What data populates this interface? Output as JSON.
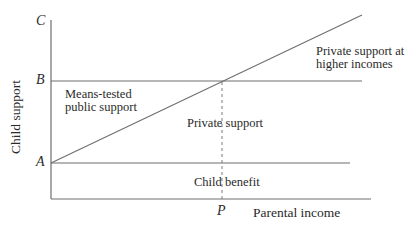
{
  "diagram": {
    "type": "economic-diagram",
    "y_axis": {
      "label": "Child support",
      "ticks": [
        {
          "label": "A",
          "y": 163
        },
        {
          "label": "B",
          "y": 81
        },
        {
          "label": "C",
          "y": 22
        }
      ]
    },
    "x_axis": {
      "label": "Parental income",
      "ticks": [
        {
          "label": "P",
          "x": 222
        }
      ]
    },
    "regions": {
      "means_tested_line1": "Means-tested",
      "means_tested_line2": "public support",
      "private_support": "Private support",
      "child_benefit": "Child benefit",
      "private_higher_line1": "Private support at",
      "private_higher_line2": "higher incomes"
    },
    "lines": [
      {
        "name": "y-axis",
        "x1": 51,
        "y1": 20,
        "x2": 51,
        "y2": 199
      },
      {
        "name": "x-axis",
        "x1": 51,
        "y1": 199,
        "x2": 371,
        "y2": 199
      },
      {
        "name": "level-B",
        "x1": 51,
        "y1": 81,
        "x2": 362,
        "y2": 81
      },
      {
        "name": "level-A",
        "x1": 51,
        "y1": 163,
        "x2": 350,
        "y2": 163
      },
      {
        "name": "private-support-diagonal",
        "x1": 51,
        "y1": 163,
        "x2": 362,
        "y2": 15
      },
      {
        "name": "income-P-dashed",
        "x1": 222,
        "y1": 81,
        "x2": 222,
        "y2": 199,
        "dashed": true
      }
    ],
    "line_color": "#6e6e6e"
  }
}
